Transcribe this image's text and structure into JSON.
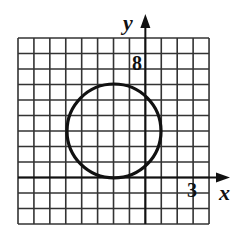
{
  "diagram": {
    "type": "coordinate-grid-with-circle",
    "grid": {
      "columns": 12,
      "rows": 12,
      "left": 18,
      "top": 38,
      "cell_w": 15.92,
      "cell_h": 15.5,
      "line_color": "#333333"
    },
    "axes": {
      "x_label": "x",
      "y_label": "y",
      "x_axis_row": 9,
      "y_axis_col": 8
    },
    "tick_labels": {
      "y_tick": "8",
      "x_tick": "3"
    },
    "circle": {
      "cx": 114,
      "cy": 131,
      "r": 47,
      "stroke": "#111111"
    }
  }
}
